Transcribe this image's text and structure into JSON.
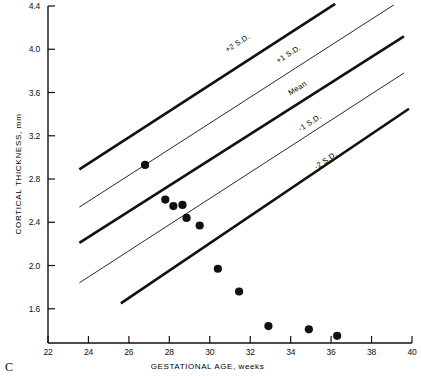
{
  "panel": {
    "label": "C"
  },
  "axes": {
    "x_title": "GESTATIONAL AGE, weeks",
    "y_title": "CORTICAL THICKNESS, mm",
    "x_ticks": [
      "22",
      "24",
      "26",
      "28",
      "30",
      "32",
      "34",
      "36",
      "38",
      "40"
    ],
    "y_ticks": [
      "4.4",
      "4.0",
      "3.6",
      "3.2",
      "2.8",
      "2.4",
      "2.0",
      "1.6"
    ]
  },
  "chart_data": {
    "type": "scatter",
    "title": "",
    "xlabel": "GESTATIONAL AGE, weeks",
    "ylabel": "CORTICAL THICKNESS, mm",
    "xlim": [
      22,
      40
    ],
    "ylim": [
      1.28,
      4.4
    ],
    "grid": false,
    "legend": "inline-line-labels",
    "x": [
      26.8,
      27.8,
      28.2,
      28.65,
      28.85,
      29.5,
      30.4,
      31.45,
      32.9,
      34.9,
      36.3
    ],
    "y": [
      2.93,
      2.61,
      2.55,
      2.56,
      2.44,
      2.37,
      1.97,
      1.76,
      1.44,
      1.41,
      1.35
    ],
    "points": [
      {
        "x": 26.8,
        "y": 2.93
      },
      {
        "x": 27.8,
        "y": 2.61
      },
      {
        "x": 28.2,
        "y": 2.55
      },
      {
        "x": 28.65,
        "y": 2.56
      },
      {
        "x": 28.85,
        "y": 2.44
      },
      {
        "x": 29.5,
        "y": 2.37
      },
      {
        "x": 30.4,
        "y": 1.97
      },
      {
        "x": 31.45,
        "y": 1.76
      },
      {
        "x": 32.9,
        "y": 1.44
      },
      {
        "x": 34.9,
        "y": 1.41
      },
      {
        "x": 36.3,
        "y": 1.35
      }
    ],
    "series": [
      {
        "name": "+2 S.D.",
        "label": "+2 S.D.",
        "type": "line",
        "weight": "thick",
        "x": [
          23.55,
          36.2
        ],
        "y": [
          2.89,
          4.42
        ],
        "label_x": 30.8,
        "label_y": 4.03
      },
      {
        "name": "+1 S.D.",
        "label": "+1 S.D.",
        "type": "line",
        "weight": "thin",
        "x": [
          23.55,
          39.1
        ],
        "y": [
          2.54,
          4.41
        ],
        "label_x": 33.3,
        "label_y": 3.93
      },
      {
        "name": "Mean",
        "label": "Mean",
        "type": "line",
        "weight": "thick",
        "x": [
          23.55,
          39.6
        ],
        "y": [
          2.21,
          4.12
        ],
        "label_x": 33.9,
        "label_y": 3.63
      },
      {
        "name": "-1 S.D.",
        "label": "-1 S.D.",
        "type": "line",
        "weight": "thin",
        "x": [
          23.55,
          39.6
        ],
        "y": [
          1.84,
          3.78
        ],
        "label_x": 34.4,
        "label_y": 3.3
      },
      {
        "name": "-2 S.D.",
        "label": "-2 S.D.",
        "type": "line",
        "weight": "thick",
        "x": [
          25.6,
          39.85
        ],
        "y": [
          1.65,
          3.45
        ],
        "label_x": 35.2,
        "label_y": 2.95
      }
    ]
  }
}
